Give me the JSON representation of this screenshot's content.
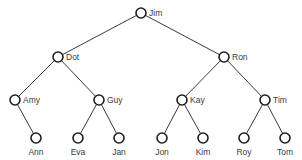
{
  "diagram": {
    "type": "binary-tree",
    "colors": {
      "line": "#3a3a3a",
      "node_stroke": "#1e1e1e",
      "text": "#3a3a3a",
      "background": "#ffffff"
    },
    "node_radius": 5,
    "nodes": [
      {
        "id": "jim",
        "label": "Jim",
        "x": 141,
        "y": 13,
        "label_pos": "right"
      },
      {
        "id": "dot",
        "label": "Dot",
        "x": 58,
        "y": 57,
        "label_pos": "right"
      },
      {
        "id": "ron",
        "label": "Ron",
        "x": 224,
        "y": 57,
        "label_pos": "right"
      },
      {
        "id": "amy",
        "label": "Amy",
        "x": 15,
        "y": 100,
        "label_pos": "right"
      },
      {
        "id": "guy",
        "label": "Guy",
        "x": 99,
        "y": 100,
        "label_pos": "right"
      },
      {
        "id": "kay",
        "label": "Kay",
        "x": 182,
        "y": 100,
        "label_pos": "right"
      },
      {
        "id": "tim",
        "label": "Tim",
        "x": 265,
        "y": 100,
        "label_pos": "right"
      },
      {
        "id": "ann",
        "label": "Ann",
        "x": 36,
        "y": 138,
        "label_pos": "below"
      },
      {
        "id": "eva",
        "label": "Eva",
        "x": 78,
        "y": 138,
        "label_pos": "below"
      },
      {
        "id": "jan",
        "label": "Jan",
        "x": 119,
        "y": 138,
        "label_pos": "below"
      },
      {
        "id": "jon",
        "label": "Jon",
        "x": 162,
        "y": 138,
        "label_pos": "below"
      },
      {
        "id": "kim",
        "label": "Kim",
        "x": 203,
        "y": 138,
        "label_pos": "below"
      },
      {
        "id": "roy",
        "label": "Roy",
        "x": 244,
        "y": 138,
        "label_pos": "below"
      },
      {
        "id": "tom",
        "label": "Tom",
        "x": 285,
        "y": 138,
        "label_pos": "below"
      }
    ],
    "edges": [
      [
        "jim",
        "dot"
      ],
      [
        "jim",
        "ron"
      ],
      [
        "dot",
        "amy"
      ],
      [
        "dot",
        "guy"
      ],
      [
        "ron",
        "kay"
      ],
      [
        "ron",
        "tim"
      ],
      [
        "amy",
        "ann"
      ],
      [
        "guy",
        "eva"
      ],
      [
        "guy",
        "jan"
      ],
      [
        "kay",
        "jon"
      ],
      [
        "kay",
        "kim"
      ],
      [
        "tim",
        "roy"
      ],
      [
        "tim",
        "tom"
      ]
    ]
  }
}
